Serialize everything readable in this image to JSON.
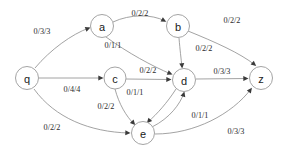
{
  "diagram": {
    "type": "directed-graph",
    "colors": {
      "background": "#ffffff",
      "node_stroke": "#9a9a9a",
      "node_fill": "#ffffff",
      "node_text": "#1a1a1a",
      "edge_stroke": "#8c8c8c",
      "edge_label_text": "#2b2b2b",
      "arrow_fill": "#3a3a3a"
    },
    "nodes": [
      {
        "id": "q",
        "label": "q",
        "x": 27,
        "y": 78,
        "r": 11.5
      },
      {
        "id": "a",
        "label": "a",
        "x": 102,
        "y": 26,
        "r": 11.5
      },
      {
        "id": "b",
        "label": "b",
        "x": 178,
        "y": 26,
        "r": 11.5
      },
      {
        "id": "c",
        "label": "c",
        "x": 115,
        "y": 78,
        "r": 11.0
      },
      {
        "id": "d",
        "label": "d",
        "x": 184,
        "y": 80,
        "r": 11.5
      },
      {
        "id": "e",
        "label": "e",
        "x": 143,
        "y": 133,
        "r": 11.5
      },
      {
        "id": "z",
        "label": "z",
        "x": 261,
        "y": 78,
        "r": 11.5
      }
    ],
    "edges": [
      {
        "from": "q",
        "to": "a",
        "label": "0/3/3",
        "label_x": 42,
        "label_y": 31,
        "path": "M 35,68 C 50,50 72,34 89,28",
        "tip_x": 90.5,
        "tip_y": 27.6,
        "angle": -20
      },
      {
        "from": "q",
        "to": "c",
        "label": "0/4/4",
        "label_x": 72,
        "label_y": 89,
        "path": "M 39,78 L 102,78",
        "tip_x": 103.5,
        "tip_y": 78,
        "angle": 0
      },
      {
        "from": "q",
        "to": "e",
        "label": "0/2/2",
        "label_x": 52,
        "label_y": 127,
        "path": "M 34,89 C 55,118 90,132 129,133",
        "tip_x": 130.5,
        "tip_y": 133,
        "angle": 2
      },
      {
        "from": "a",
        "to": "b",
        "label": "0/2/2",
        "label_x": 140,
        "label_y": 13,
        "path": "M 113,22 C 130,14 152,14 165,21",
        "tip_x": 166.3,
        "tip_y": 21.8,
        "angle": 28
      },
      {
        "from": "a",
        "to": "d",
        "label": "0/1/1",
        "label_x": 113,
        "label_y": 45,
        "path": "M 106,37 C 128,53 152,66 171,74",
        "tip_x": 172.5,
        "tip_y": 74.6,
        "angle": 23
      },
      {
        "from": "b",
        "to": "z",
        "label": "0/2/2",
        "label_x": 232,
        "label_y": 20,
        "path": "M 188,31 C 215,42 240,53 255,65",
        "tip_x": 256.2,
        "tip_y": 66.0,
        "angle": 40
      },
      {
        "from": "b",
        "to": "d",
        "label": "0/2/2",
        "label_x": 204,
        "label_y": 48,
        "path": "M 179,38 C 180,50 181,58 182,67",
        "tip_x": 182.2,
        "tip_y": 68.5,
        "angle": 85
      },
      {
        "from": "c",
        "to": "d",
        "label": "0/2/2",
        "label_x": 148,
        "label_y": 70,
        "path": "M 126,79 L 170,79.5",
        "tip_x": 171.5,
        "tip_y": 79.5,
        "angle": 1
      },
      {
        "from": "c",
        "to": "e",
        "label": "0/2/2",
        "label_x": 106,
        "label_y": 106,
        "path": "M 115,89 C 119,104 126,116 134,124",
        "tip_x": 135.2,
        "tip_y": 125.1,
        "angle": 48
      },
      {
        "from": "d",
        "to": "z",
        "label": "0/3/3",
        "label_x": 222,
        "label_y": 71,
        "path": "M 196,79 L 247,78.5",
        "tip_x": 248.5,
        "tip_y": 78.5,
        "angle": -1
      },
      {
        "from": "d",
        "to": "e",
        "label": "0/1/1",
        "label_x": 135,
        "label_y": 92,
        "path": "M 176,89 C 167,103 157,114 148,122",
        "tip_x": 146.8,
        "tip_y": 123.2,
        "angle": 132
      },
      {
        "from": "e",
        "to": "d",
        "label": "0/1/1",
        "label_x": 200,
        "label_y": 115,
        "path": "M 152,127 C 170,118 180,104 184,93",
        "tip_x": 184.4,
        "tip_y": 91.6,
        "angle": -73
      },
      {
        "from": "e",
        "to": "z",
        "label": "0/3/3",
        "label_x": 236,
        "label_y": 131,
        "path": "M 155,134 C 195,134 232,114 251,89",
        "tip_x": 251.9,
        "tip_y": 87.8,
        "angle": -54
      }
    ]
  }
}
